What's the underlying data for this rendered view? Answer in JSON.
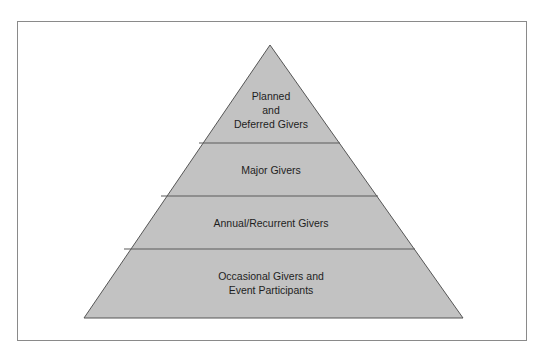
{
  "diagram": {
    "type": "pyramid",
    "colors": {
      "fill": "#c2c2c2",
      "stroke": "#555555",
      "divider": "#5a5a5a",
      "text": "#1e1e1e",
      "frame": "#8a8a8a"
    },
    "tiers": [
      {
        "id": "planned",
        "lines": [
          "Planned",
          "and",
          "Deferred Givers"
        ]
      },
      {
        "id": "major",
        "lines": [
          "Major Givers"
        ]
      },
      {
        "id": "annual",
        "lines": [
          "Annual/Recurrent Givers"
        ]
      },
      {
        "id": "occasional",
        "lines": [
          "Occasional Givers and",
          "Event Participants"
        ]
      }
    ]
  }
}
